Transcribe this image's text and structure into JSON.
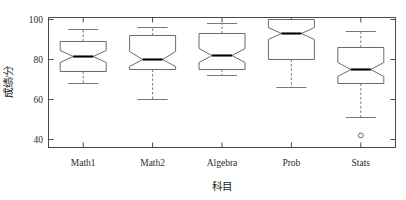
{
  "chart_data": {
    "type": "box",
    "title": "",
    "xlabel": "科目",
    "ylabel": "成绩/分",
    "categories": [
      "Math1",
      "Math2",
      "Algebra",
      "Prob",
      "Stats"
    ],
    "ylim": [
      36,
      101
    ],
    "yticks": [
      40,
      60,
      80,
      100
    ],
    "ytick_labels": [
      "40",
      "60",
      "80",
      "100"
    ],
    "grid": false,
    "legend": "none",
    "notched": true,
    "boxes": [
      {
        "category": "Math1",
        "whisker_low": 68,
        "q1": 74,
        "median": 81.5,
        "q3": 89,
        "whisker_high": 95,
        "notch_low": 78.5,
        "notch_high": 84.5,
        "outliers": []
      },
      {
        "category": "Math2",
        "whisker_low": 60,
        "q1": 75,
        "median": 80,
        "q3": 92,
        "whisker_high": 96,
        "notch_low": 76.5,
        "notch_high": 84,
        "outliers": []
      },
      {
        "category": "Algebra",
        "whisker_low": 72,
        "q1": 75,
        "median": 82,
        "q3": 93,
        "whisker_high": 98,
        "notch_low": 78.5,
        "notch_high": 85.5,
        "outliers": []
      },
      {
        "category": "Prob",
        "whisker_low": 66,
        "q1": 80,
        "median": 93,
        "q3": 100,
        "whisker_high": 99,
        "notch_low": 90,
        "notch_high": 96,
        "outliers": []
      },
      {
        "category": "Stats",
        "whisker_low": 51,
        "q1": 68,
        "median": 75,
        "q3": 86,
        "whisker_high": 94,
        "notch_low": 71.5,
        "notch_high": 78.5,
        "outliers": [
          42
        ]
      }
    ]
  },
  "axes": {
    "y_title": "成绩/分",
    "x_title": "科目",
    "ytick_0": "40",
    "ytick_1": "60",
    "ytick_2": "80",
    "ytick_3": "100"
  },
  "cats": {
    "c0": "Math1",
    "c1": "Math2",
    "c2": "Algebra",
    "c3": "Prob",
    "c4": "Stats"
  },
  "colors": {
    "frame": "#4a4a4a",
    "box": "#5a5a5a",
    "median": "#000000",
    "whisker": "#6a6a6a",
    "background": "#ffffff"
  }
}
